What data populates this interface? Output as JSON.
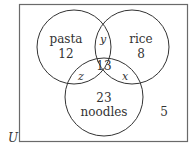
{
  "diagram": {
    "type": "venn",
    "universe_label": "U",
    "outside_value": "5",
    "sets": [
      {
        "name": "pasta",
        "only_value": "12"
      },
      {
        "name": "rice",
        "only_value": "8"
      },
      {
        "name": "noodles",
        "only_value": "23"
      }
    ],
    "regions": {
      "pasta_rice_only": "y",
      "pasta_noodles_only": "z",
      "rice_noodles_only": "x",
      "all_three": "13"
    },
    "colors": {
      "stroke": "#333333",
      "border": "#666666",
      "background": "#ffffff"
    }
  }
}
